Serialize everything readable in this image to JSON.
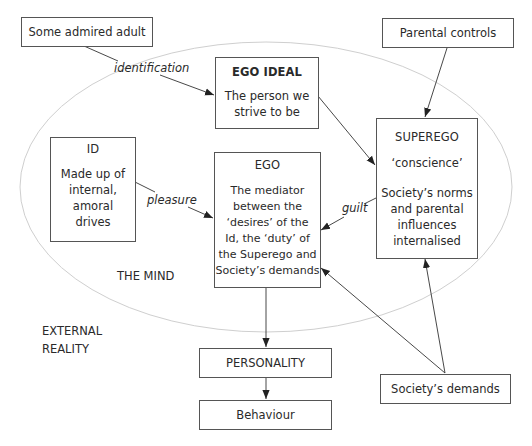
{
  "diagram": {
    "type": "psychoanalytic-personality-model",
    "regions": {
      "inner": "THE MIND",
      "outer_line1": "EXTERNAL",
      "outer_line2": "REALITY"
    },
    "nodes": {
      "admired_adult": {
        "title": "Some admired adult"
      },
      "parental_controls": {
        "title": "Parental controls"
      },
      "ego_ideal": {
        "title": "EGO IDEAL",
        "body": [
          "The person we",
          "strive to be"
        ]
      },
      "id": {
        "title": "ID",
        "body": [
          "Made up of",
          "internal,",
          "amoral",
          "drives"
        ]
      },
      "ego": {
        "title": "EGO",
        "body": [
          "The mediator",
          "between the",
          "‘desires’ of the",
          "Id, the ‘duty’ of",
          "the Superego and",
          "Society’s demands"
        ]
      },
      "superego": {
        "title": "SUPEREGO",
        "subtitle": "‘conscience’",
        "body": [
          "Society’s norms",
          "and parental",
          "influences",
          "internalised"
        ]
      },
      "personality": {
        "title": "PERSONALITY"
      },
      "behaviour": {
        "title": "Behaviour"
      },
      "societys_demands": {
        "title": "Society’s demands"
      }
    },
    "edges": [
      {
        "from": "admired_adult",
        "to": "ego_ideal",
        "label": "identification"
      },
      {
        "from": "parental_controls",
        "to": "superego",
        "label": ""
      },
      {
        "from": "ego_ideal",
        "to": "superego",
        "label": ""
      },
      {
        "from": "id",
        "to": "ego",
        "label": "pleasure"
      },
      {
        "from": "superego",
        "to": "ego",
        "label": "guilt"
      },
      {
        "from": "societys_demands",
        "to": "ego",
        "label": ""
      },
      {
        "from": "societys_demands",
        "to": "superego",
        "label": ""
      },
      {
        "from": "ego",
        "to": "personality",
        "label": ""
      },
      {
        "from": "personality",
        "to": "behaviour",
        "label": ""
      }
    ],
    "edge_labels": {
      "identification": "identification",
      "pleasure": "pleasure",
      "guilt": "guilt"
    },
    "colors": {
      "box_border": "#555555",
      "arrow": "#333333",
      "ellipse": "#cccccc",
      "text": "#2a2a2a"
    }
  }
}
